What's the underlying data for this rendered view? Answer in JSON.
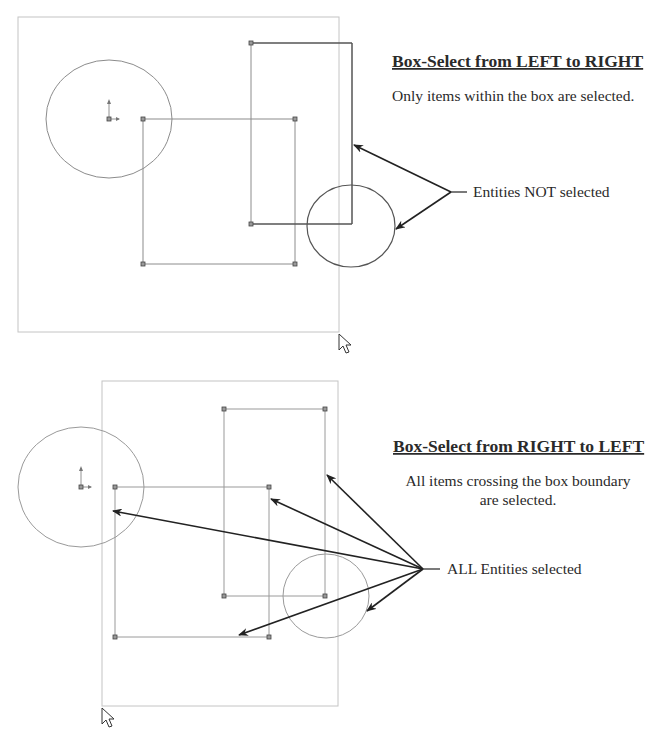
{
  "top_panel": {
    "heading": "Box-Select from LEFT to RIGHT",
    "description": "Only items within the box are selected.",
    "callout": "Entities NOT selected",
    "selection_box": {
      "x1": 18,
      "y1": 17,
      "x2": 339,
      "y2": 332
    },
    "cursor_icon": "arrow-cursor-icon"
  },
  "bottom_panel": {
    "heading": "Box-Select from RIGHT to LEFT",
    "description_line1": "All items crossing the box boundary",
    "description_line2": "are selected.",
    "callout": "ALL Entities selected",
    "selection_box": {
      "x1": 102,
      "y1": 381,
      "x2": 338,
      "y2": 706
    },
    "cursor_icon": "arrow-cursor-icon"
  },
  "colors": {
    "selection_box": "#c4c4c4",
    "entity": "#8c8c8c",
    "entity_unselected": "#555555",
    "arrow": "#222222",
    "text": "#2a2a2a"
  }
}
